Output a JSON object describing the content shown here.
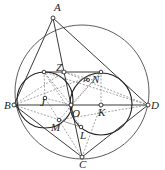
{
  "diagram": {
    "type": "geometry",
    "points": {
      "A": {
        "label": "A",
        "x": 53,
        "y": 18
      },
      "B": {
        "label": "B",
        "x": 14,
        "y": 105
      },
      "C": {
        "label": "C",
        "x": 82,
        "y": 157
      },
      "D": {
        "label": "D",
        "x": 148,
        "y": 105
      },
      "O": {
        "label": "O",
        "x": 71,
        "y": 105
      },
      "J": {
        "label": "J",
        "x": 45,
        "y": 98
      },
      "K": {
        "label": "K",
        "x": 101,
        "y": 105
      },
      "Z": {
        "label": "Z",
        "x": 64,
        "y": 72
      },
      "M": {
        "label": "M",
        "x": 59,
        "y": 120
      },
      "L": {
        "label": "L",
        "x": 81,
        "y": 127
      },
      "N": {
        "label": "N",
        "x": 93,
        "y": 80
      },
      "P": {
        "label": "P",
        "x": 88,
        "y": 79
      }
    },
    "labels": [
      "A",
      "B",
      "C",
      "D",
      "O",
      "J",
      "K",
      "Z",
      "M",
      "L",
      "N",
      "P"
    ],
    "stroke_color": "#222222",
    "dash_color": "#555555"
  }
}
